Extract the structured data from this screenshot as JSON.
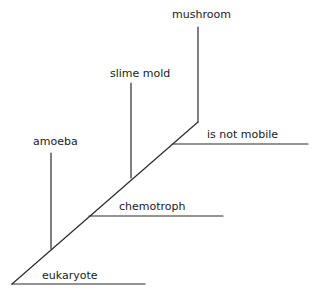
{
  "diagram": {
    "type": "cladogram",
    "root_label": "eukaryote",
    "line_color": "#2a2a2a",
    "text_color": "#1a1a1a",
    "taxa": [
      {
        "name": "amoeba"
      },
      {
        "name": "slime mold"
      },
      {
        "name": "mushroom"
      }
    ],
    "characters": [
      {
        "name": "eukaryote"
      },
      {
        "name": "chemotroph"
      },
      {
        "name": "is not mobile"
      }
    ]
  }
}
